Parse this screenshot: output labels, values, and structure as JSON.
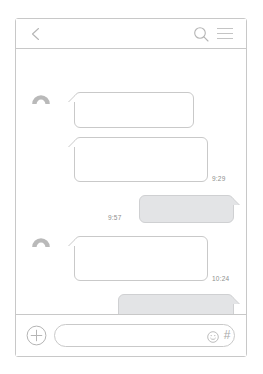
{
  "app": {
    "title": "Chat Conversation",
    "frame": "phone-mockup"
  },
  "header": {
    "back_icon": "chevron-left-icon",
    "search_icon": "search-icon",
    "menu_icon": "hamburger-menu-icon"
  },
  "conversation": {
    "avatars": [
      {
        "icon": "person-avatar-icon"
      },
      {
        "icon": "person-avatar-icon"
      }
    ],
    "messages": [
      {
        "id": "bubble-1",
        "direction": "incoming",
        "text": "",
        "timestamp": ""
      },
      {
        "id": "bubble-2",
        "direction": "incoming",
        "text": "",
        "timestamp": "9:29"
      },
      {
        "id": "bubble-3",
        "direction": "outgoing",
        "text": "",
        "timestamp": "9:57"
      },
      {
        "id": "bubble-4",
        "direction": "incoming",
        "text": "",
        "timestamp": "10:24"
      },
      {
        "id": "bubble-5",
        "direction": "outgoing",
        "text": "",
        "timestamp": "10:43"
      }
    ],
    "timestamps": {
      "t1": "9:29",
      "t2": "9:57",
      "t3": "10:24",
      "t4": "10:43"
    }
  },
  "input_bar": {
    "add_icon": "plus-circle-icon",
    "field_value": "",
    "field_placeholder": "",
    "emoji_icon": "smiley-face-icon",
    "hash_icon": "hash-icon",
    "hash_label": "#"
  },
  "colors": {
    "frame_border": "#c8c8c8",
    "bubble_border": "#c9c9c9",
    "outgoing_fill": "#e3e4e6",
    "icon_gray": "#b5b5b5",
    "timestamp_gray": "#8e8e8e",
    "avatar_gray": "#b9b9b9",
    "background": "#ffffff"
  }
}
